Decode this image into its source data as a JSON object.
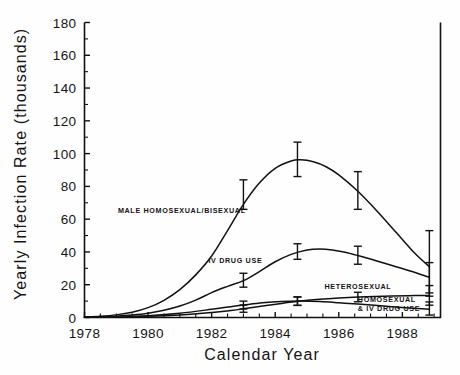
{
  "figure": {
    "background": "#fefefe",
    "ink": "#111111"
  },
  "chart_data": {
    "type": "line",
    "title": "",
    "xlabel": "Calendar Year",
    "ylabel": "Yearly Infection Rate (thousands)",
    "xlim": [
      1978,
      1989.2
    ],
    "ylim": [
      0,
      180
    ],
    "grid": false,
    "legend_position": "inline-annotations",
    "y_major_ticks": [
      0,
      20,
      40,
      60,
      80,
      100,
      120,
      140,
      160,
      180
    ],
    "y_major_tick_labels": [
      "0",
      "20",
      "40",
      "60",
      "80",
      "100",
      "120",
      "140",
      "160",
      "180"
    ],
    "y_minor_tick_step": 10,
    "x_major_ticks": [
      1978,
      1980,
      1982,
      1984,
      1986,
      1988
    ],
    "x_major_tick_labels": [
      "1978",
      "1980",
      "1982",
      "1984",
      "1986",
      "1988"
    ],
    "x_minor_tick_step": 0.5,
    "series": [
      {
        "name": "MALE HOMOSEXUAL/BISEXUAL",
        "label_x": 1979.05,
        "label_y": 64,
        "x": [
          1978,
          1978.5,
          1979,
          1979.5,
          1980,
          1980.5,
          1981,
          1981.5,
          1982,
          1982.5,
          1983,
          1983.5,
          1984,
          1984.5,
          1984.8,
          1985.2,
          1985.6,
          1986,
          1986.6,
          1987.2,
          1987.8,
          1988.4,
          1988.85
        ],
        "values": [
          0.4,
          0.8,
          1.6,
          3.2,
          6.0,
          10.5,
          17.0,
          26.0,
          37.5,
          53.0,
          69.0,
          82.0,
          91.0,
          95.5,
          96.2,
          95.0,
          92.0,
          87.0,
          77.0,
          65.0,
          52.0,
          39.0,
          31.0
        ],
        "error_bars": [
          {
            "x": 1983.0,
            "y": 74.0,
            "lower": 66.0,
            "upper": 84.0
          },
          {
            "x": 1984.7,
            "y": 96.0,
            "lower": 86.0,
            "upper": 107.0
          },
          {
            "x": 1986.6,
            "y": 77.0,
            "lower": 66.0,
            "upper": 89.0
          },
          {
            "x": 1988.85,
            "y": 31.0,
            "lower": 15.0,
            "upper": 53.0
          }
        ]
      },
      {
        "name": "IV DRUG USE",
        "label_x": 1981.9,
        "label_y": 33,
        "x": [
          1978,
          1978.5,
          1979,
          1979.5,
          1980,
          1980.5,
          1981,
          1981.5,
          1982,
          1982.5,
          1983,
          1983.5,
          1984,
          1984.5,
          1985,
          1985.4,
          1985.8,
          1986.2,
          1986.6,
          1987.2,
          1987.8,
          1988.4,
          1988.85
        ],
        "values": [
          0.2,
          0.4,
          0.8,
          1.5,
          2.6,
          4.4,
          7.0,
          10.6,
          15.2,
          19.0,
          22.5,
          28.0,
          34.0,
          38.5,
          41.2,
          41.8,
          41.2,
          39.8,
          37.8,
          34.5,
          31.0,
          27.5,
          24.5
        ],
        "error_bars": [
          {
            "x": 1983.0,
            "y": 22.5,
            "lower": 18.5,
            "upper": 27.0
          },
          {
            "x": 1984.7,
            "y": 40.0,
            "lower": 35.5,
            "upper": 45.0
          },
          {
            "x": 1986.6,
            "y": 37.8,
            "lower": 32.5,
            "upper": 43.5
          },
          {
            "x": 1988.85,
            "y": 24.5,
            "lower": 13.0,
            "upper": 33.5
          }
        ]
      },
      {
        "name": "HETEROSEXUAL",
        "label_x": 1985.55,
        "label_y": 17.5,
        "x": [
          1978,
          1979,
          1980,
          1981,
          1982,
          1982.6,
          1983,
          1983.6,
          1984.2,
          1984.8,
          1985.4,
          1986,
          1986.6,
          1987.4,
          1988.2,
          1988.85
        ],
        "values": [
          0.1,
          0.3,
          0.7,
          1.6,
          3.1,
          4.3,
          5.3,
          7.0,
          8.6,
          10.0,
          11.1,
          11.9,
          12.5,
          13.0,
          13.3,
          13.5
        ],
        "error_bars": [
          {
            "x": 1983.0,
            "y": 5.3,
            "lower": 3.2,
            "upper": 7.6
          },
          {
            "x": 1984.7,
            "y": 9.9,
            "lower": 7.4,
            "upper": 12.5
          },
          {
            "x": 1986.6,
            "y": 12.5,
            "lower": 9.6,
            "upper": 15.4
          },
          {
            "x": 1988.85,
            "y": 13.5,
            "lower": 7.5,
            "upper": 19.5
          }
        ]
      },
      {
        "name": "HOMOSEXUAL & IV DRUG USE",
        "label_x": 1986.6,
        "label_y": 9.2,
        "x": [
          1978,
          1979,
          1980,
          1981,
          1982,
          1982.6,
          1983,
          1983.6,
          1984.2,
          1984.8,
          1985.4,
          1986,
          1986.6,
          1987.4,
          1988.2,
          1988.85
        ],
        "values": [
          0.1,
          0.4,
          1.1,
          2.6,
          5.0,
          6.6,
          7.6,
          9.0,
          9.8,
          10.0,
          9.7,
          9.0,
          8.2,
          7.0,
          5.8,
          5.0
        ],
        "error_bars": [
          {
            "x": 1983.0,
            "y": 7.6,
            "lower": 5.2,
            "upper": 10.0
          },
          {
            "x": 1984.7,
            "y": 10.0,
            "lower": 7.4,
            "upper": 12.6
          },
          {
            "x": 1988.85,
            "y": 5.0,
            "lower": 1.5,
            "upper": 9.5
          }
        ]
      }
    ]
  },
  "caption": {
    "text": ""
  }
}
